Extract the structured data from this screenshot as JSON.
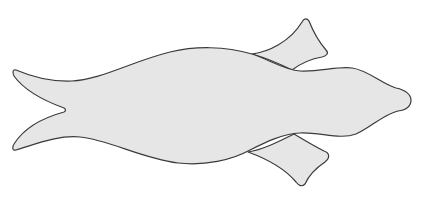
{
  "figure": {
    "colors": {
      "background": "#ffffff",
      "fill": "#e6e6e6",
      "outline": "#3a3a3a"
    },
    "parts": [
      {
        "name": "body"
      },
      {
        "name": "tail"
      },
      {
        "name": "upper-flipper"
      },
      {
        "name": "lower-flipper"
      },
      {
        "name": "bill"
      }
    ]
  }
}
